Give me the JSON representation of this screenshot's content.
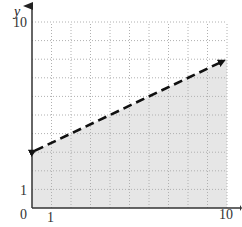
{
  "chart_data": {
    "type": "line",
    "title": "",
    "xlabel": "",
    "ylabel": "y",
    "xlim": [
      0,
      10
    ],
    "ylim": [
      0,
      10
    ],
    "grid": true,
    "grid_style": "dotted",
    "x_ticks_labeled": [
      "0",
      "1",
      "10"
    ],
    "y_ticks_labeled": [
      "1",
      "10"
    ],
    "origin_label": "0",
    "series": [
      {
        "name": "boundary line",
        "style": "dashed",
        "arrows": "both",
        "x": [
          0,
          10
        ],
        "y": [
          3,
          8
        ],
        "equation": "y = 0.5x + 3"
      }
    ],
    "shaded_region": "below the dashed line (y < 0.5x + 3), within 0 ≤ x ≤ 10, 0 ≤ y",
    "colors": {
      "shade": "#e6e6e6",
      "line": "#111111",
      "grid": "#b0b0b0",
      "axis": "#333333"
    }
  },
  "labels": {
    "y_axis": "y",
    "origin": "0",
    "x_one": "1",
    "x_ten": "10",
    "y_one": "1",
    "y_ten": "10"
  }
}
